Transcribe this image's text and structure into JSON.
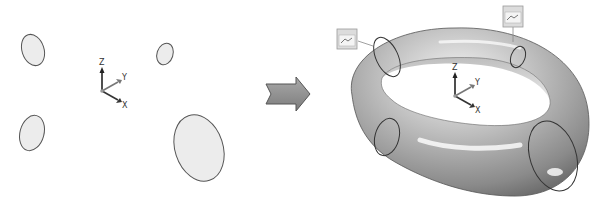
{
  "diagram": {
    "left_panel": {
      "name": "cross-section profiles",
      "profiles": [
        {
          "id": 1,
          "cx": 33,
          "cy": 50,
          "rx": 12,
          "ry": 17,
          "rot": -15
        },
        {
          "id": 2,
          "cx": 165,
          "cy": 54,
          "rx": 8,
          "ry": 11,
          "rot": 15
        },
        {
          "id": 3,
          "cx": 32,
          "cy": 133,
          "rx": 12,
          "ry": 18,
          "rot": 15
        },
        {
          "id": 4,
          "cx": 198,
          "cy": 149,
          "rx": 24,
          "ry": 34,
          "rot": -18
        }
      ],
      "triad": {
        "x_label": "X",
        "y_label": "Y",
        "z_label": "Z"
      }
    },
    "arrow": {
      "direction": "right",
      "meaning": "result"
    },
    "right_panel": {
      "name": "lofted torus surface",
      "triad": {
        "x_label": "X",
        "y_label": "Y",
        "z_label": "Z"
      },
      "tags": [
        "tag-left",
        "tag-top-right"
      ]
    },
    "colors": {
      "profile_fill": "#ececec",
      "profile_stroke": "#555555",
      "surface_light": "#e8e8e8",
      "surface_dark": "#7a7a7a",
      "arrow_fill": "#8f8f8f"
    }
  }
}
